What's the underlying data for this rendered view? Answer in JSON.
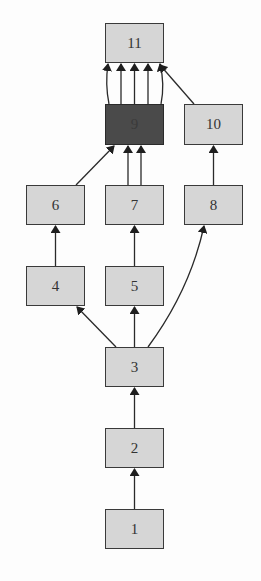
{
  "diagram": {
    "type": "directed-graph",
    "nodes": [
      {
        "id": "1",
        "label": "1",
        "x": 105,
        "y": 509,
        "w": 59,
        "h": 40,
        "highlighted": false
      },
      {
        "id": "2",
        "label": "2",
        "x": 105,
        "y": 428,
        "w": 59,
        "h": 40,
        "highlighted": false
      },
      {
        "id": "3",
        "label": "3",
        "x": 105,
        "y": 347,
        "w": 59,
        "h": 40,
        "highlighted": false
      },
      {
        "id": "4",
        "label": "4",
        "x": 26,
        "y": 266,
        "w": 59,
        "h": 40,
        "highlighted": false
      },
      {
        "id": "5",
        "label": "5",
        "x": 105,
        "y": 266,
        "w": 59,
        "h": 40,
        "highlighted": false
      },
      {
        "id": "6",
        "label": "6",
        "x": 26,
        "y": 185,
        "w": 59,
        "h": 40,
        "highlighted": false
      },
      {
        "id": "7",
        "label": "7",
        "x": 105,
        "y": 185,
        "w": 59,
        "h": 40,
        "highlighted": false
      },
      {
        "id": "8",
        "label": "8",
        "x": 184,
        "y": 185,
        "w": 59,
        "h": 40,
        "highlighted": false
      },
      {
        "id": "9",
        "label": "9",
        "x": 105,
        "y": 104,
        "w": 59,
        "h": 41,
        "highlighted": true
      },
      {
        "id": "10",
        "label": "10",
        "x": 184,
        "y": 104,
        "w": 59,
        "h": 41,
        "highlighted": false
      },
      {
        "id": "11",
        "label": "11",
        "x": 105,
        "y": 23,
        "w": 59,
        "h": 40,
        "highlighted": false
      }
    ],
    "edges": [
      {
        "from": "1",
        "to": "2"
      },
      {
        "from": "2",
        "to": "3"
      },
      {
        "from": "3",
        "to": "4"
      },
      {
        "from": "3",
        "to": "5"
      },
      {
        "from": "3",
        "to": "8"
      },
      {
        "from": "4",
        "to": "6"
      },
      {
        "from": "5",
        "to": "7"
      },
      {
        "from": "6",
        "to": "9"
      },
      {
        "from": "7",
        "to": "9"
      },
      {
        "from": "7",
        "to": "9"
      },
      {
        "from": "8",
        "to": "10"
      },
      {
        "from": "9",
        "to": "11"
      },
      {
        "from": "9",
        "to": "11"
      },
      {
        "from": "9",
        "to": "11"
      },
      {
        "from": "9",
        "to": "11"
      },
      {
        "from": "9",
        "to": "11"
      },
      {
        "from": "10",
        "to": "11"
      }
    ],
    "colors": {
      "node_fill": "#d6d6d6",
      "node_highlight_fill": "#4a4a4a",
      "edge": "#2a2a2a",
      "border": "#3a3a3a"
    }
  }
}
